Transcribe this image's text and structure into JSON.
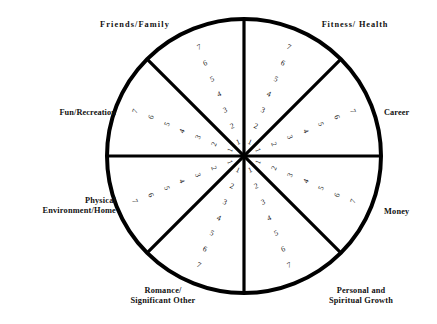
{
  "diagram": {
    "type": "wheel-of-life",
    "geometry": {
      "center_x": 244,
      "center_y": 156,
      "radius": 137,
      "sector_count": 8,
      "scale_min": 1,
      "scale_max": 7
    },
    "colors": {
      "background": "#ffffff",
      "stroke": "#000000",
      "text": "#111111"
    },
    "scale_values": [
      1,
      2,
      3,
      4,
      5,
      6,
      7
    ],
    "sectors": [
      {
        "id": "friends-family",
        "label": "Friends/Family",
        "label_lines": [
          "Friends/Family"
        ],
        "mid_angle_deg": -112.5,
        "scale_values": [
          1,
          2,
          3,
          4,
          5,
          6,
          7
        ]
      },
      {
        "id": "fitness-health",
        "label": "Fitness/ Health",
        "label_lines": [
          "Fitness/ Health"
        ],
        "mid_angle_deg": -67.5,
        "scale_values": [
          1,
          2,
          3,
          4,
          5,
          6,
          7
        ]
      },
      {
        "id": "career",
        "label": "Career",
        "label_lines": [
          "Career"
        ],
        "mid_angle_deg": -22.5,
        "scale_values": [
          1,
          2,
          3,
          4,
          5,
          6,
          7
        ]
      },
      {
        "id": "money",
        "label": "Money",
        "label_lines": [
          "Money"
        ],
        "mid_angle_deg": 22.5,
        "scale_values": [
          1,
          2,
          3,
          4,
          5,
          6,
          7
        ]
      },
      {
        "id": "personal-spiritual-growth",
        "label": "Personal and Spiritual Growth",
        "label_lines": [
          "Personal and",
          "Spiritual Growth"
        ],
        "mid_angle_deg": 67.5,
        "scale_values": [
          1,
          2,
          3,
          4,
          5,
          6,
          7
        ]
      },
      {
        "id": "romance-significant-other",
        "label": "Romance/ Significant Other",
        "label_lines": [
          "Romance/",
          "Significant Other"
        ],
        "mid_angle_deg": 112.5,
        "scale_values": [
          1,
          2,
          3,
          4,
          5,
          6,
          7
        ]
      },
      {
        "id": "physical-environment-home",
        "label": "Physical Environment/Home",
        "label_lines": [
          "Physical",
          "Environment/Home"
        ],
        "mid_angle_deg": 157.5,
        "scale_values": [
          1,
          2,
          3,
          4,
          5,
          6,
          7
        ]
      },
      {
        "id": "fun-recreation",
        "label": "Fun/Recreation",
        "label_lines": [
          "Fun/Recreation"
        ],
        "mid_angle_deg": 202.5,
        "scale_values": [
          1,
          2,
          3,
          4,
          5,
          6,
          7
        ]
      }
    ]
  }
}
